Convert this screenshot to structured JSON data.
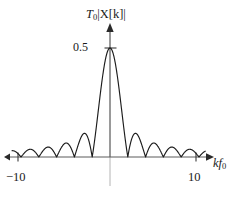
{
  "figure": {
    "background_color": "#ffffff",
    "curve_color": "#1c1c1c",
    "axis_color": "#5a5a5a",
    "gridline_color": "#b4b4b4"
  },
  "labels": {
    "ylabel_main": "T",
    "ylabel_sub": "0",
    "ylabel_rest": "|X[k]|",
    "ylabel_full": "T0|X[k]|",
    "xlabel_main": "kf",
    "xlabel_sub": "0",
    "xlabel_full": "kf0",
    "ytick": "0.5",
    "xtick_left": "−10",
    "xtick_right": "10"
  },
  "chart_data": {
    "type": "line",
    "title": "",
    "subtitle": "",
    "xlabel": "kf0",
    "ylabel": "T0|X[k]|",
    "legend": [],
    "legend_position": "none",
    "grid": false,
    "center_gridline": true,
    "xlim": [
      -11.0,
      10.7
    ],
    "ylim": [
      0,
      0.58
    ],
    "xticks": [
      -10,
      10
    ],
    "xticklabels": [
      "−10",
      "10"
    ],
    "yticks": [
      0.5
    ],
    "yticklabels": [
      "0.5"
    ],
    "peak_value": 0.5,
    "peak_x": 0,
    "main_lobe_zeros": [
      -2,
      2
    ],
    "lobe_spacing": 2,
    "function": "0.5 * |sin(pi*x/2) / (pi*x/2)|",
    "annotations": [],
    "x": [
      -10.6,
      -10.4,
      -10.2,
      -10,
      -9.8,
      -9.6,
      -9.4,
      -9.2,
      -9,
      -8.8,
      -8.6,
      -8.4,
      -8.2,
      -8,
      -7.8,
      -7.6,
      -7.4,
      -7.2,
      -7,
      -6.8,
      -6.6,
      -6.4,
      -6.2,
      -6,
      -5.8,
      -5.6,
      -5.4,
      -5.2,
      -5,
      -4.8,
      -4.6,
      -4.4,
      -4.2,
      -4,
      -3.8,
      -3.6,
      -3.4,
      -3.2,
      -3,
      -2.8,
      -2.6,
      -2.4,
      -2.2,
      -2,
      -1.8,
      -1.6,
      -1.4,
      -1.2,
      -1,
      -0.8,
      -0.6,
      -0.4,
      -0.2,
      0,
      0.2,
      0.4,
      0.6,
      0.8,
      1,
      1.2,
      1.4,
      1.6,
      1.8,
      2,
      2.2,
      2.4,
      2.6,
      2.8,
      3,
      3.2,
      3.4,
      3.6,
      3.8,
      4,
      4.2,
      4.4,
      4.6,
      4.8,
      5,
      5.2,
      5.4,
      5.6,
      5.8,
      6,
      6.2,
      6.4,
      6.6,
      6.8,
      7,
      7.2,
      7.4,
      7.6,
      7.8,
      8,
      8.2,
      8.4,
      8.6,
      8.8,
      9,
      9.2,
      9.4,
      9.6,
      9.8,
      10,
      10.2
    ],
    "y": [
      0.0089,
      0.0178,
      0.0093,
      0.0,
      0.0097,
      0.019,
      0.0099,
      0.0,
      0.0105,
      0.0205,
      0.0107,
      0.0,
      0.0114,
      0.0223,
      0.0116,
      0.0,
      0.0125,
      0.0244,
      0.0127,
      0.0,
      0.0137,
      0.0269,
      0.014,
      0.0,
      0.0152,
      0.0298,
      0.0155,
      0.0,
      0.017,
      0.0333,
      0.0174,
      0.0,
      0.0192,
      0.0377,
      0.0196,
      0.0,
      0.0221,
      0.0434,
      0.0226,
      0.0,
      0.026,
      0.051,
      0.0266,
      0.0,
      0.0313,
      0.0618,
      0.0325,
      0.0,
      0.0405,
      0.0804,
      0.0428,
      0.0,
      0.0597,
      0.119,
      0.0638,
      0.0,
      0.1158,
      0.2339,
      0.1262,
      0.0,
      0.4132,
      0.4677,
      0.4959,
      0.5,
      0.4959,
      0.4677,
      0.4132,
      0.0,
      0.1262,
      0.2339,
      0.1158,
      0.0,
      0.0638,
      0.119,
      0.0597,
      0.0,
      0.0428,
      0.0804,
      0.0405,
      0.0,
      0.0325,
      0.0618,
      0.0313,
      0.0,
      0.0266,
      0.051,
      0.026,
      0.0,
      0.0226,
      0.0434,
      0.0221,
      0.0,
      0.0196,
      0.0377,
      0.0192,
      0.0,
      0.0174,
      0.0333,
      0.017,
      0.0,
      0.0155,
      0.0298,
      0.0152,
      0.0,
      0.014,
      0.0269
    ]
  }
}
